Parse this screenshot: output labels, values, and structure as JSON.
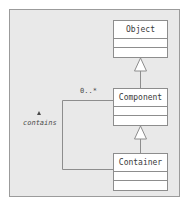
{
  "diagram": {
    "canvas": {
      "background_color": "#e9e9e9",
      "border_color": "#9b9b9b"
    },
    "classes": [
      {
        "id": "object",
        "name": "Object",
        "compartments": [
          "attributes",
          "operations"
        ]
      },
      {
        "id": "component",
        "name": "Component",
        "compartments": [
          "attributes",
          "operations"
        ]
      },
      {
        "id": "container",
        "name": "Container",
        "compartments": [
          "attributes",
          "operations"
        ]
      }
    ],
    "relationships": [
      {
        "id": "component-generalizes-object",
        "type": "generalization",
        "from": "Component",
        "to": "Object",
        "arrow": "hollow-triangle"
      },
      {
        "id": "container-generalizes-component",
        "type": "generalization",
        "from": "Container",
        "to": "Component",
        "arrow": "hollow-triangle"
      },
      {
        "id": "container-contains-component",
        "type": "association",
        "from": "Container",
        "to": "Component",
        "label": "contains",
        "multiplicity": "0..*",
        "direction_marker": "filled-triangle"
      }
    ],
    "labels": {
      "multiplicity": "0..*",
      "association_name": "contains"
    },
    "colors": {
      "class_fill": "#ffffff",
      "line": "#8d8d8d",
      "text": "#3a3a3a"
    }
  }
}
